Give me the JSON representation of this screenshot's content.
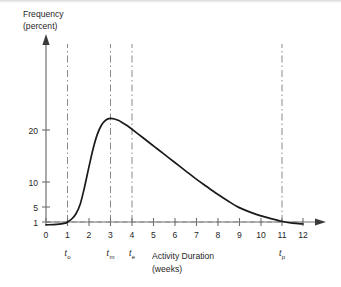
{
  "chart_data": {
    "type": "line",
    "title": "",
    "xlabel": "Activity Duration",
    "xlabel_unit": "(weeks)",
    "ylabel": "Frequency",
    "ylabel_unit": "(percent)",
    "xlim": [
      0,
      12.6
    ],
    "ylim": [
      0,
      24
    ],
    "grid": false,
    "legend": null,
    "x_ticks": [
      "0",
      "1",
      "2",
      "3",
      "4",
      "5",
      "6",
      "7",
      "8",
      "9",
      "10",
      "11",
      "12"
    ],
    "x_tick_values": [
      0,
      1,
      2,
      3,
      4,
      5,
      6,
      7,
      8,
      9,
      10,
      11,
      12
    ],
    "y_ticks": [
      "1",
      "5",
      "10",
      "20"
    ],
    "y_tick_values": [
      1,
      5,
      10,
      20
    ],
    "series": [
      {
        "name": "Beta distribution of activity duration",
        "x": [
          0.0,
          0.5,
          0.9,
          1.0,
          1.2,
          1.4,
          1.6,
          1.8,
          2.0,
          2.2,
          2.4,
          2.6,
          2.8,
          3.0,
          3.2,
          3.4,
          3.6,
          3.8,
          4.0,
          4.5,
          5.0,
          5.5,
          6.0,
          6.5,
          7.0,
          7.5,
          8.0,
          8.5,
          9.0,
          9.5,
          10.0,
          10.5,
          11.0,
          11.5,
          12.0
        ],
        "values": [
          0.3,
          0.4,
          0.7,
          1.0,
          1.8,
          3.2,
          5.6,
          9.0,
          12.8,
          16.4,
          19.2,
          21.0,
          21.9,
          22.2,
          22.1,
          21.8,
          21.3,
          20.8,
          20.2,
          18.6,
          17.0,
          15.4,
          13.8,
          12.2,
          10.6,
          9.1,
          7.6,
          6.2,
          4.9,
          3.7,
          2.7,
          1.9,
          1.2,
          0.7,
          0.5
        ]
      }
    ],
    "reference_line": {
      "name": "one-percent-baseline",
      "orientation": "horizontal",
      "value": 1,
      "style": "dashed",
      "x_from": 0,
      "x_to": 12.3
    },
    "markers": [
      {
        "id": "t-optimistic",
        "label": "t",
        "sub": "o",
        "x": 1,
        "style": "dash-dot"
      },
      {
        "id": "t-most-likely",
        "label": "t",
        "sub": "m",
        "x": 3,
        "style": "dash-dot"
      },
      {
        "id": "t-expected",
        "label": "t",
        "sub": "e",
        "x": 4,
        "style": "dash-dot"
      },
      {
        "id": "t-pessimistic",
        "label": "t",
        "sub": "p",
        "x": 11,
        "style": "dash-dot"
      }
    ],
    "colors": {
      "curve": "#1a1a1a",
      "axis": "#707070",
      "marker": "#8a8a8a",
      "reference": "#8a8a8a",
      "text": "#1f1f1f",
      "background": "#ffffff"
    }
  }
}
